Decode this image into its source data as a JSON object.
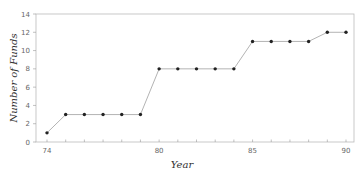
{
  "chart_data": {
    "type": "line",
    "title": "",
    "xlabel": "Year",
    "ylabel": "Number of Funds",
    "x": [
      74,
      75,
      76,
      77,
      78,
      79,
      80,
      81,
      82,
      83,
      84,
      85,
      86,
      87,
      88,
      89,
      90
    ],
    "series": [
      {
        "name": "Number of Funds",
        "values": [
          1,
          3,
          3,
          3,
          3,
          3,
          8,
          8,
          8,
          8,
          8,
          11,
          11,
          11,
          11,
          12,
          12
        ]
      }
    ],
    "xlim": [
      74,
      90
    ],
    "ylim": [
      0,
      14
    ],
    "yticks": [
      0,
      2,
      4,
      6,
      8,
      10,
      12,
      14
    ],
    "xtick_labels": [
      74,
      80,
      85,
      90
    ],
    "grid": false,
    "legend": "none",
    "colors": {
      "line": "#aaaaaa",
      "marker": "#222222",
      "frame": "#bbbbbb"
    }
  }
}
